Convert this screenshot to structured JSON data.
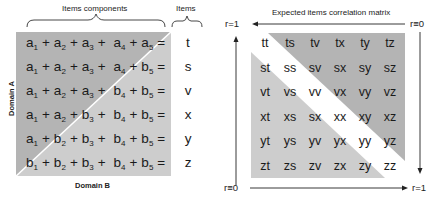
{
  "left_panel": {
    "header_components": "Items components",
    "header_items": "Items",
    "axis_domain_a": "Domain A",
    "axis_domain_b": "Domain B",
    "rows": [
      {
        "terms": [
          [
            "a",
            "1"
          ],
          [
            "a",
            "2"
          ],
          [
            "a",
            "3"
          ],
          [
            "a",
            "4"
          ],
          [
            "a",
            "5"
          ]
        ],
        "item": "t"
      },
      {
        "terms": [
          [
            "a",
            "1"
          ],
          [
            "a",
            "2"
          ],
          [
            "a",
            "3"
          ],
          [
            "a",
            "4"
          ],
          [
            "b",
            "5"
          ]
        ],
        "item": "s"
      },
      {
        "terms": [
          [
            "a",
            "1"
          ],
          [
            "a",
            "2"
          ],
          [
            "a",
            "3"
          ],
          [
            "b",
            "4"
          ],
          [
            "b",
            "5"
          ]
        ],
        "item": "v"
      },
      {
        "terms": [
          [
            "a",
            "1"
          ],
          [
            "a",
            "2"
          ],
          [
            "b",
            "3"
          ],
          [
            "b",
            "4"
          ],
          [
            "b",
            "5"
          ]
        ],
        "item": "x"
      },
      {
        "terms": [
          [
            "a",
            "1"
          ],
          [
            "b",
            "2"
          ],
          [
            "b",
            "3"
          ],
          [
            "b",
            "4"
          ],
          [
            "b",
            "5"
          ]
        ],
        "item": "y"
      },
      {
        "terms": [
          [
            "b",
            "1"
          ],
          [
            "b",
            "2"
          ],
          [
            "b",
            "3"
          ],
          [
            "b",
            "4"
          ],
          [
            "b",
            "5"
          ]
        ],
        "item": "z"
      }
    ],
    "colors": {
      "dark_region": "#b4b4b4",
      "light_region": "#cdcdcd",
      "divider": "#ffffff"
    }
  },
  "right_panel": {
    "title": "Expected items correlation matrix",
    "label_top_left": "r=1",
    "label_top_right": "r≡0",
    "label_bottom_left": "r≡0",
    "label_bottom_right": "r=1",
    "matrix": [
      [
        "tt",
        "ts",
        "tv",
        "tx",
        "ty",
        "tz"
      ],
      [
        "st",
        "ss",
        "sv",
        "sx",
        "sy",
        "sz"
      ],
      [
        "vt",
        "vs",
        "vv",
        "vx",
        "vy",
        "vz"
      ],
      [
        "xt",
        "xs",
        "sx",
        "xx",
        "xy",
        "xz"
      ],
      [
        "yt",
        "ys",
        "yv",
        "yx",
        "yy",
        "yz"
      ],
      [
        "zt",
        "zs",
        "zv",
        "zx",
        "zy",
        "zz"
      ]
    ],
    "colors": {
      "upper_triangle": "#b4b4b4",
      "lower_triangle": "#cdcdcd",
      "diagonal_band": "#ffffff"
    }
  }
}
